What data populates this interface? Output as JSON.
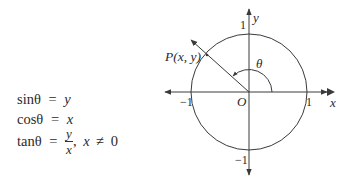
{
  "formulas": {
    "sin": {
      "lhs": "sinθ",
      "eq": "=",
      "rhs": "y"
    },
    "cos": {
      "lhs": "cosθ",
      "eq": "=",
      "rhs": "x"
    },
    "tan": {
      "lhs": "tanθ",
      "eq": "=",
      "num": "y",
      "den": "x",
      "cond_var": "x",
      "cond_rel": "≠",
      "cond_val": "0",
      "sep": ","
    }
  },
  "diagram": {
    "point_label": "P(x, y)",
    "angle_label": "θ",
    "origin_label": "O",
    "x_axis_label": "x",
    "y_axis_label": "y",
    "tick_pos_x": "1",
    "tick_neg_x": "−1",
    "tick_pos_y": "1",
    "tick_neg_y": "−1",
    "center": [
      249,
      92
    ],
    "radius": 58,
    "stroke_color": "#3a3a3a"
  }
}
